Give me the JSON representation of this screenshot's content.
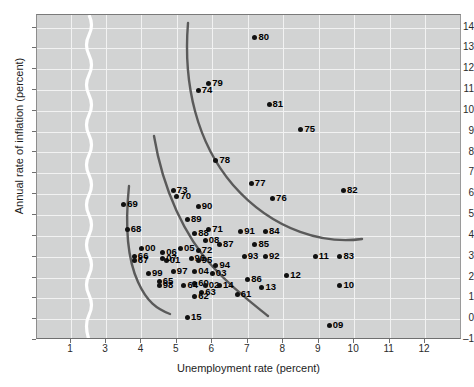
{
  "chart_data": {
    "type": "scatter",
    "title": "",
    "xlabel": "Unemployment rate (percent)",
    "ylabel": "Annual rate of inflation (percent)",
    "xlim": [
      0.4,
      12.4
    ],
    "ylim": [
      -1,
      14.6
    ],
    "xticks": [
      1,
      3,
      4,
      5,
      6,
      7,
      8,
      9,
      10,
      11,
      12
    ],
    "yticks": [
      -1,
      0,
      1,
      2,
      3,
      4,
      5,
      6,
      7,
      8,
      9,
      10,
      11,
      12,
      13,
      14
    ],
    "grid": true,
    "legend": null,
    "axis_break": {
      "axis": "x",
      "between": [
        1,
        3
      ],
      "style": "white-wavy-line"
    },
    "point_label_field": "year (two digits)",
    "points": [
      {
        "label": "80",
        "x": 7.2,
        "y": 13.5
      },
      {
        "label": "79",
        "x": 5.9,
        "y": 11.3
      },
      {
        "label": "74",
        "x": 5.6,
        "y": 11.0
      },
      {
        "label": "81",
        "x": 7.6,
        "y": 10.3
      },
      {
        "label": "75",
        "x": 8.5,
        "y": 9.1
      },
      {
        "label": "78",
        "x": 6.1,
        "y": 7.6
      },
      {
        "label": "77",
        "x": 7.1,
        "y": 6.5
      },
      {
        "label": "82",
        "x": 9.7,
        "y": 6.2
      },
      {
        "label": "76",
        "x": 7.7,
        "y": 5.8
      },
      {
        "label": "73",
        "x": 4.9,
        "y": 6.2
      },
      {
        "label": "70",
        "x": 5.0,
        "y": 5.9
      },
      {
        "label": "69",
        "x": 3.5,
        "y": 5.5
      },
      {
        "label": "90",
        "x": 5.6,
        "y": 5.4
      },
      {
        "label": "89",
        "x": 5.3,
        "y": 4.8
      },
      {
        "label": "68",
        "x": 3.6,
        "y": 4.3
      },
      {
        "label": "71",
        "x": 5.9,
        "y": 4.3
      },
      {
        "label": "91",
        "x": 6.8,
        "y": 4.2
      },
      {
        "label": "84",
        "x": 7.5,
        "y": 4.2
      },
      {
        "label": "88",
        "x": 5.5,
        "y": 4.1
      },
      {
        "label": "08",
        "x": 5.8,
        "y": 3.8
      },
      {
        "label": "87",
        "x": 6.2,
        "y": 3.6
      },
      {
        "label": "85",
        "x": 7.2,
        "y": 3.6
      },
      {
        "label": "00",
        "x": 4.0,
        "y": 3.4
      },
      {
        "label": "05",
        "x": 5.1,
        "y": 3.4
      },
      {
        "label": "06",
        "x": 4.6,
        "y": 3.2
      },
      {
        "label": "72",
        "x": 5.6,
        "y": 3.3
      },
      {
        "label": "93",
        "x": 6.9,
        "y": 3.0
      },
      {
        "label": "92",
        "x": 7.5,
        "y": 3.0
      },
      {
        "label": "66",
        "x": 3.8,
        "y": 3.0
      },
      {
        "label": "96",
        "x": 5.4,
        "y": 2.9
      },
      {
        "label": "95",
        "x": 5.6,
        "y": 2.8
      },
      {
        "label": "01",
        "x": 4.7,
        "y": 2.8
      },
      {
        "label": "07",
        "x": 4.6,
        "y": 2.9
      },
      {
        "label": "67",
        "x": 3.8,
        "y": 2.8
      },
      {
        "label": "11",
        "x": 8.9,
        "y": 3.0
      },
      {
        "label": "83",
        "x": 9.6,
        "y": 3.0
      },
      {
        "label": "94",
        "x": 6.1,
        "y": 2.6
      },
      {
        "label": "04",
        "x": 5.5,
        "y": 2.3
      },
      {
        "label": "97",
        "x": 4.9,
        "y": 2.3
      },
      {
        "label": "99",
        "x": 4.2,
        "y": 2.2
      },
      {
        "label": "03",
        "x": 6.0,
        "y": 2.2
      },
      {
        "label": "86",
        "x": 7.0,
        "y": 1.9
      },
      {
        "label": "12",
        "x": 8.1,
        "y": 2.1
      },
      {
        "label": "65",
        "x": 4.5,
        "y": 1.8
      },
      {
        "label": "60",
        "x": 5.5,
        "y": 1.7
      },
      {
        "label": "02",
        "x": 5.8,
        "y": 1.6
      },
      {
        "label": "14",
        "x": 6.2,
        "y": 1.6
      },
      {
        "label": "98",
        "x": 4.5,
        "y": 1.6
      },
      {
        "label": "64",
        "x": 5.2,
        "y": 1.6
      },
      {
        "label": "13",
        "x": 7.4,
        "y": 1.5
      },
      {
        "label": "10",
        "x": 9.6,
        "y": 1.6
      },
      {
        "label": "63",
        "x": 5.7,
        "y": 1.3
      },
      {
        "label": "61",
        "x": 6.7,
        "y": 1.2
      },
      {
        "label": "62",
        "x": 5.5,
        "y": 1.1
      },
      {
        "label": "15",
        "x": 5.3,
        "y": 0.1
      },
      {
        "label": "09",
        "x": 9.3,
        "y": -0.3
      }
    ],
    "curves": [
      {
        "name": "phillips-curve-left",
        "description": "short steep curve through 1960s points"
      },
      {
        "name": "phillips-curve-middle",
        "description": "middle shifted curve"
      },
      {
        "name": "phillips-curve-right",
        "description": "outermost 1970s-80s curve"
      }
    ],
    "colors": {
      "plot_background": "#d2d3d3",
      "gridline": "#f2f2f2",
      "point": "#111111",
      "curve": "#5a5a5a",
      "axis_break": "#ffffff"
    }
  }
}
